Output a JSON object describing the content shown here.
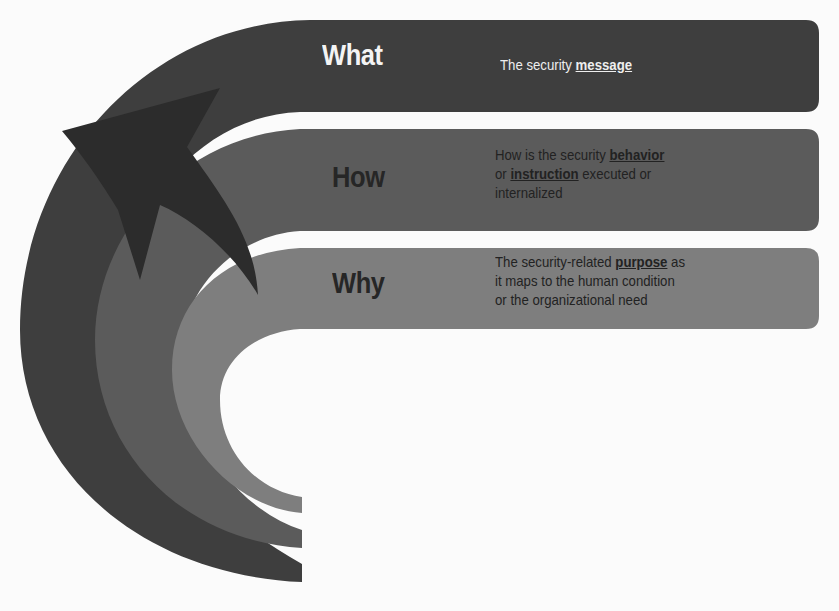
{
  "diagram": {
    "colors": {
      "background": "#fbfbfb",
      "what_band": "#3e3e3e",
      "how_band": "#5b5b5b",
      "why_band": "#7e7e7e",
      "arrow": "#2c2c2c"
    },
    "bands": [
      {
        "title": "What",
        "desc_lines": [
          "The security ",
          "message",
          ""
        ],
        "description": "The security message",
        "emphasis": "message"
      },
      {
        "title": "How",
        "desc_line1_pre": "How is the security ",
        "desc_line1_em": "behavior",
        "desc_line2_pre": "or ",
        "desc_line2_em": "instruction",
        "desc_line2_post": " executed or",
        "desc_line3": "internalized",
        "emphasis": [
          "behavior",
          "instruction"
        ]
      },
      {
        "title": "Why",
        "desc_line1_pre": "The security-related ",
        "desc_line1_em": "purpose",
        "desc_line1_post": " as",
        "desc_line2": "it maps to the human condition",
        "desc_line3": "or the organizational need",
        "emphasis": "purpose"
      }
    ]
  }
}
